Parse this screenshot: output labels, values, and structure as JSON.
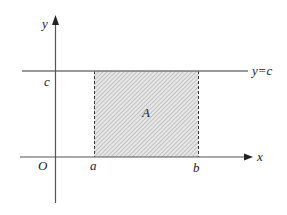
{
  "diagram": {
    "axes": {
      "x_label": "x",
      "y_label": "y",
      "origin_label": "O"
    },
    "line": {
      "label": "y=c",
      "y_tick_label": "c"
    },
    "region": {
      "label": "A",
      "left_label": "a",
      "right_label": "b",
      "fill": "hatched gray"
    },
    "colors": {
      "axis": "#444444",
      "line": "#666666",
      "hatch": "#9a9a9a",
      "region_bg": "#e6e6e6"
    }
  }
}
